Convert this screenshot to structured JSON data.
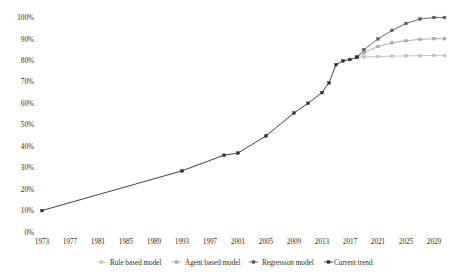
{
  "chart_data": {
    "type": "line",
    "title": "",
    "xlabel": "",
    "ylabel": "",
    "x": [
      1973,
      1977,
      1981,
      1985,
      1989,
      1993,
      1997,
      2001,
      2005,
      2009,
      2013,
      2017,
      2021,
      2025,
      2029
    ],
    "xlim": [
      1973,
      2031
    ],
    "ylim": [
      0,
      100
    ],
    "yticks": [
      0,
      10,
      20,
      30,
      40,
      50,
      60,
      70,
      80,
      90,
      100
    ],
    "ytick_labels": [
      "0%",
      "10%",
      "20%",
      "30%",
      "40%",
      "50%",
      "60%",
      "70%",
      "80%",
      "90%",
      "100%"
    ],
    "xtick_labels": [
      "1973",
      "1977",
      "1981",
      "1985",
      "1989",
      "1993",
      "1997",
      "2001",
      "2005",
      "2009",
      "2013",
      "2017",
      "2021",
      "2025",
      "2029"
    ],
    "grid": false,
    "legend_position": "bottom",
    "series": [
      {
        "name": "Rule based model",
        "color": "#bfbfbf",
        "marker": "square",
        "points": [
          [
            2018,
            81.5
          ],
          [
            2019,
            81.6
          ],
          [
            2021,
            81.8
          ],
          [
            2023,
            82.0
          ],
          [
            2025,
            82.1
          ],
          [
            2027,
            82.2
          ],
          [
            2029,
            82.3
          ],
          [
            2030.5,
            82.3
          ]
        ]
      },
      {
        "name": "Agent based model",
        "color": "#a6a6a6",
        "marker": "square",
        "points": [
          [
            2018,
            81.5
          ],
          [
            2019,
            83.5
          ],
          [
            2021,
            86.5
          ],
          [
            2023,
            88.2
          ],
          [
            2025,
            89.2
          ],
          [
            2027,
            89.8
          ],
          [
            2029,
            90.1
          ],
          [
            2030.5,
            90.1
          ]
        ]
      },
      {
        "name": "Regression model",
        "color": "#595959",
        "marker": "square",
        "points": [
          [
            2018,
            81.5
          ],
          [
            2019,
            85.0
          ],
          [
            2021,
            90.0
          ],
          [
            2023,
            94.0
          ],
          [
            2025,
            97.2
          ],
          [
            2027,
            99.3
          ],
          [
            2029,
            100.0
          ],
          [
            2030.5,
            100.0
          ]
        ]
      },
      {
        "name": "Current trend",
        "color": "#2b2b2b",
        "marker": "square",
        "points": [
          [
            1973,
            10.0
          ],
          [
            1993,
            28.5
          ],
          [
            1999,
            35.8
          ],
          [
            2001,
            36.8
          ],
          [
            2005,
            44.8
          ],
          [
            2009,
            55.5
          ],
          [
            2011,
            60.0
          ],
          [
            2013,
            65.0
          ],
          [
            2014,
            69.5
          ],
          [
            2015,
            78.0
          ],
          [
            2016,
            79.8
          ],
          [
            2017,
            80.4
          ],
          [
            2018,
            81.5
          ]
        ]
      }
    ]
  },
  "legend": {
    "items": [
      {
        "label": "Rule based model",
        "color": "#bfbfbf"
      },
      {
        "label": "Agent based model",
        "color": "#a6a6a6"
      },
      {
        "label": "Regression model",
        "color": "#595959"
      },
      {
        "label": "Current trend",
        "color": "#2b2b2b"
      }
    ]
  }
}
